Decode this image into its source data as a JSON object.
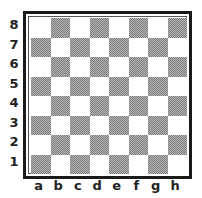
{
  "board": {
    "ranks": [
      "8",
      "7",
      "6",
      "5",
      "4",
      "3",
      "2",
      "1"
    ],
    "files": [
      "a",
      "b",
      "c",
      "d",
      "e",
      "f",
      "g",
      "h"
    ],
    "light_color": "#ffffff",
    "dark_color": "#9a9a9a",
    "frame_color": "#1a1a1a",
    "pieces": []
  }
}
